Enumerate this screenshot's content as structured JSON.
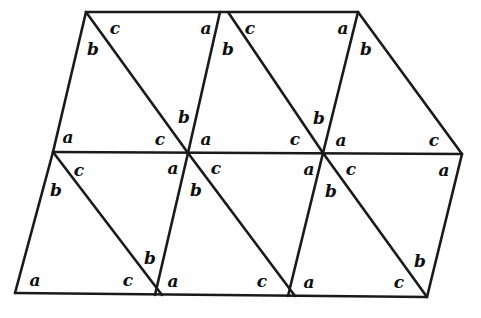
{
  "figure": {
    "stroke_color": "#1a1a1a",
    "background_color": "#fefefe",
    "label_color": "#0d0d0d",
    "canvas": {
      "width": 481,
      "height": 318
    }
  },
  "geometry": {
    "points": {
      "top_left": {
        "x": 86,
        "y": 12
      },
      "top_mid_left": {
        "x": 220,
        "y": 12
      },
      "top_mid_right": {
        "x": 228,
        "y": 12
      },
      "top_right": {
        "x": 358,
        "y": 12
      },
      "mid_left": {
        "x": 53,
        "y": 152
      },
      "mid_node_1": {
        "x": 188,
        "y": 153
      },
      "mid_node_2": {
        "x": 323,
        "y": 153
      },
      "mid_right": {
        "x": 462,
        "y": 154
      },
      "bottom_left": {
        "x": 15,
        "y": 293
      },
      "bottom_node_1": {
        "x": 155,
        "y": 295
      },
      "bottom_node_2": {
        "x": 162,
        "y": 295
      },
      "bottom_node_3": {
        "x": 288,
        "y": 296
      },
      "bottom_node_4": {
        "x": 295,
        "y": 296
      },
      "bottom_right": {
        "x": 427,
        "y": 297
      }
    },
    "edges": [
      {
        "name": "top-edge",
        "path": "M 86 12 L 358 12"
      },
      {
        "name": "middle-horizontal-edge",
        "path": "M 53 152 L 462 154"
      },
      {
        "name": "bottom-edge",
        "path": "M 15 293 L 427 297"
      },
      {
        "name": "upper-left-slant",
        "path": "M 86 12 L 53 152"
      },
      {
        "name": "upper-slant-1",
        "path": "M 220 12 L 188 153"
      },
      {
        "name": "upper-slant-2",
        "path": "M 358 12 L 323 153"
      },
      {
        "name": "upper-right-slant",
        "path": "M 358 12 L 462 154"
      },
      {
        "name": "upper-diagonal-1",
        "path": "M 86 12 L 188 153"
      },
      {
        "name": "upper-diagonal-2",
        "path": "M 228 12 L 323 153"
      },
      {
        "name": "lower-left-slant",
        "path": "M 53 152 L 15 293"
      },
      {
        "name": "lower-slant-1",
        "path": "M 188 153 L 155 295"
      },
      {
        "name": "lower-slant-2",
        "path": "M 323 153 L 288 296"
      },
      {
        "name": "lower-right-slant",
        "path": "M 462 154 L 427 297"
      },
      {
        "name": "lower-diagonal-1",
        "path": "M 53 152 L 162 295"
      },
      {
        "name": "lower-diagonal-2",
        "path": "M 188 153 L 295 296"
      },
      {
        "name": "lower-diagonal-3",
        "path": "M 323 153 L 427 297"
      }
    ]
  },
  "labels": [
    {
      "id": "l01",
      "text": "c",
      "x": 115,
      "y": 28
    },
    {
      "id": "l02",
      "text": "b",
      "x": 93,
      "y": 49
    },
    {
      "id": "l03",
      "text": "a",
      "x": 206,
      "y": 28
    },
    {
      "id": "l04",
      "text": "c",
      "x": 250,
      "y": 28
    },
    {
      "id": "l05",
      "text": "b",
      "x": 228,
      "y": 49
    },
    {
      "id": "l06",
      "text": "a",
      "x": 343,
      "y": 28
    },
    {
      "id": "l07",
      "text": "b",
      "x": 366,
      "y": 49
    },
    {
      "id": "l08",
      "text": "b",
      "x": 184,
      "y": 117
    },
    {
      "id": "l09",
      "text": "b",
      "x": 319,
      "y": 118
    },
    {
      "id": "l10",
      "text": "a",
      "x": 68,
      "y": 137
    },
    {
      "id": "l11",
      "text": "c",
      "x": 160,
      "y": 139
    },
    {
      "id": "l12",
      "text": "a",
      "x": 206,
      "y": 139
    },
    {
      "id": "l13",
      "text": "c",
      "x": 295,
      "y": 139
    },
    {
      "id": "l14",
      "text": "a",
      "x": 341,
      "y": 140
    },
    {
      "id": "l15",
      "text": "c",
      "x": 434,
      "y": 140
    },
    {
      "id": "l16",
      "text": "c",
      "x": 79,
      "y": 170
    },
    {
      "id": "l17",
      "text": "a",
      "x": 173,
      "y": 168
    },
    {
      "id": "l18",
      "text": "c",
      "x": 216,
      "y": 168
    },
    {
      "id": "l19",
      "text": "a",
      "x": 309,
      "y": 169
    },
    {
      "id": "l20",
      "text": "c",
      "x": 351,
      "y": 169
    },
    {
      "id": "l21",
      "text": "a",
      "x": 444,
      "y": 170
    },
    {
      "id": "l22",
      "text": "b",
      "x": 56,
      "y": 190
    },
    {
      "id": "l23",
      "text": "b",
      "x": 196,
      "y": 190
    },
    {
      "id": "l24",
      "text": "b",
      "x": 331,
      "y": 191
    },
    {
      "id": "l25",
      "text": "b",
      "x": 150,
      "y": 258
    },
    {
      "id": "l26",
      "text": "b",
      "x": 420,
      "y": 261
    },
    {
      "id": "l27",
      "text": "a",
      "x": 35,
      "y": 280
    },
    {
      "id": "l28",
      "text": "c",
      "x": 128,
      "y": 280
    },
    {
      "id": "l29",
      "text": "a",
      "x": 173,
      "y": 281
    },
    {
      "id": "l30",
      "text": "c",
      "x": 262,
      "y": 281
    },
    {
      "id": "l31",
      "text": "a",
      "x": 309,
      "y": 282
    },
    {
      "id": "l32",
      "text": "c",
      "x": 399,
      "y": 282
    }
  ]
}
